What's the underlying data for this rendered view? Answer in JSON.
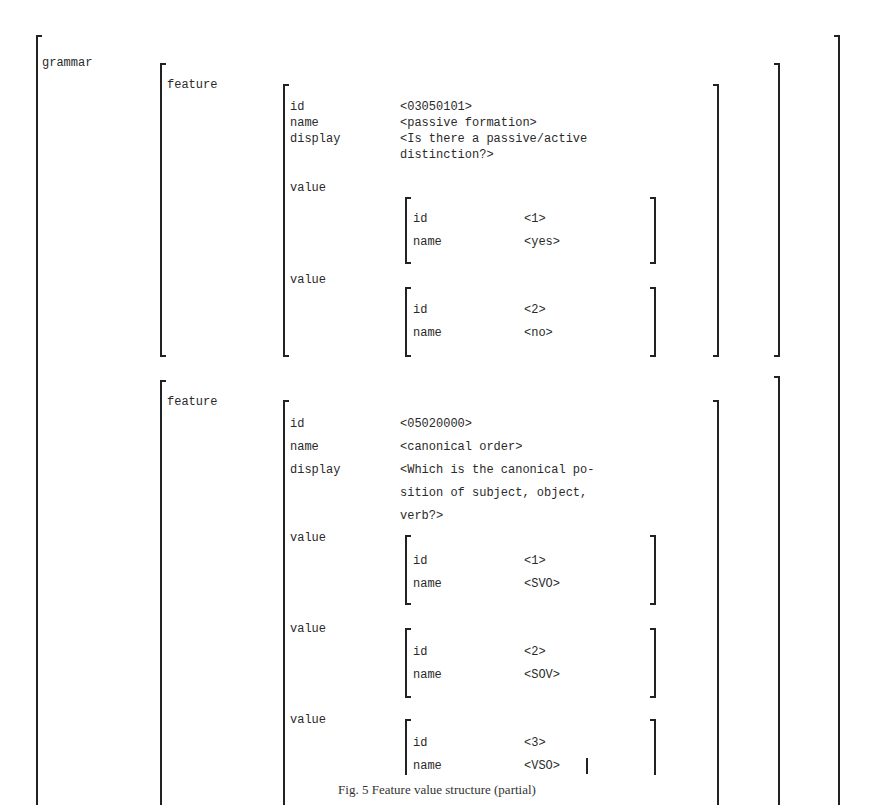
{
  "root": {
    "label": "grammar"
  },
  "features": [
    {
      "label": "feature",
      "attrs": [
        {
          "key": "id",
          "value": "<03050101>"
        },
        {
          "key": "name",
          "value": "<passive formation>"
        },
        {
          "key": "display",
          "value": "<Is there a passive/active",
          "value2": "distinction?>"
        }
      ],
      "values": [
        {
          "label": "value",
          "id_key": "id",
          "id": "<1>",
          "name_key": "name",
          "name": "<yes>"
        },
        {
          "label": "value",
          "id_key": "id",
          "id": "<2>",
          "name_key": "name",
          "name": "<no>"
        }
      ]
    },
    {
      "label": "feature",
      "attrs": [
        {
          "key": "id",
          "value": "<05020000>"
        },
        {
          "key": "name",
          "value": "<canonical order>"
        },
        {
          "key": "display",
          "value": "<Which is the canonical po-",
          "value2": "sition of subject, object,",
          "value3": "verb?>"
        }
      ],
      "values": [
        {
          "label": "value",
          "id_key": "id",
          "id": "<1>",
          "name_key": "name",
          "name": "<SVO>"
        },
        {
          "label": "value",
          "id_key": "id",
          "id": "<2>",
          "name_key": "name",
          "name": "<SOV>"
        },
        {
          "label": "value",
          "id_key": "id",
          "id": "<3>",
          "name_key": "name",
          "name": "<VSO>"
        }
      ]
    }
  ],
  "caption": "Fig. 5 Feature value structure (partial)"
}
